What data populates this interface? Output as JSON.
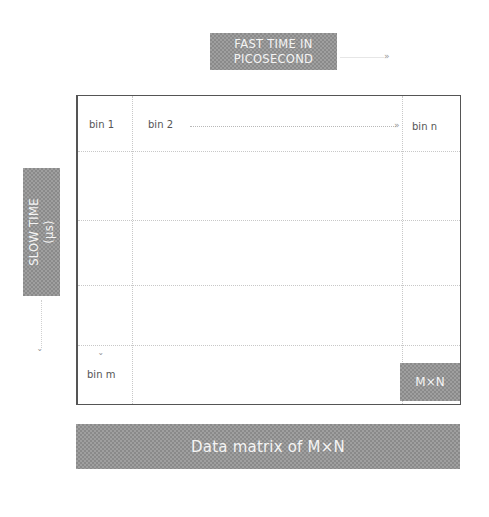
{
  "diagram": {
    "fast_time_label": "FAST TIME IN\nPICOSECOND",
    "fast_time_line1": "FAST TIME IN",
    "fast_time_line2": "PICOSECOND",
    "slow_time_line1": "SLOW TIME",
    "slow_time_line2": "(μs)",
    "bins": {
      "bin_1": "bin 1",
      "bin_2": "bin 2",
      "bin_n": "bin n",
      "bin_m": "bin m"
    },
    "matrix_cell_label": "M×N",
    "caption": "Data matrix of M×N",
    "arrow_glyph": "»",
    "down_arrow_glyph": "ˇ",
    "colors": {
      "box_fill": "#9f9f9f",
      "box_text": "#f4f4f4",
      "border": "#555555",
      "grid_dots": "#c8c8c8"
    }
  }
}
